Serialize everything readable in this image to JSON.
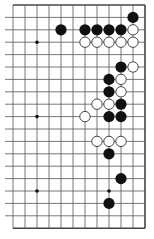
{
  "board": {
    "size": 19,
    "visible_cols": [
      7,
      18
    ],
    "visible_rows": [
      0,
      18
    ],
    "origin": {
      "x": 37,
      "y": 5,
      "col": 9,
      "row": 0
    },
    "spacing_x": 12,
    "spacing_y": 12.4,
    "stone_radius": 5.6,
    "line_color": "#555555",
    "edge_color": "#444444",
    "star_points": [
      [
        9,
        3
      ],
      [
        15,
        3
      ],
      [
        9,
        9
      ],
      [
        15,
        9
      ],
      [
        9,
        15
      ],
      [
        15,
        15
      ]
    ],
    "black_stones": [
      [
        17,
        1
      ],
      [
        11,
        2
      ],
      [
        13,
        2
      ],
      [
        14,
        2
      ],
      [
        15,
        2
      ],
      [
        16,
        2
      ],
      [
        16,
        5
      ],
      [
        15,
        6
      ],
      [
        15,
        7
      ],
      [
        16,
        8
      ],
      [
        15,
        9
      ],
      [
        16,
        9
      ],
      [
        15,
        12
      ],
      [
        16,
        14
      ],
      [
        15,
        16
      ]
    ],
    "white_stones": [
      [
        17,
        2
      ],
      [
        13,
        3
      ],
      [
        14,
        3
      ],
      [
        15,
        3
      ],
      [
        16,
        3
      ],
      [
        17,
        3
      ],
      [
        17,
        5
      ],
      [
        16,
        6
      ],
      [
        16,
        7
      ],
      [
        14,
        8
      ],
      [
        15,
        8
      ],
      [
        13,
        9
      ],
      [
        14,
        11
      ],
      [
        15,
        11
      ],
      [
        16,
        11
      ]
    ],
    "colors": {
      "black": "#111111",
      "white_fill": "#ffffff",
      "white_stroke": "#333333",
      "background": "#ffffff"
    }
  }
}
